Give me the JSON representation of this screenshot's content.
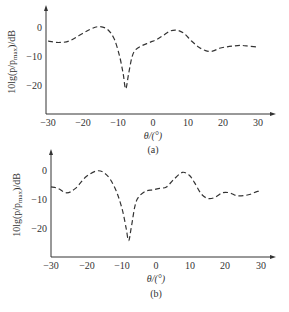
{
  "chart_data": [
    {
      "type": "line",
      "panel_label": "(a)",
      "xlabel": "θ/(°)",
      "ylabel": "10lg(p/p_max)/dB",
      "xlim": [
        -30,
        30
      ],
      "ylim": [
        -25,
        3
      ],
      "x_ticks": [
        -30,
        -20,
        -10,
        0,
        10,
        20,
        30
      ],
      "y_ticks": [
        0,
        -10,
        -20
      ],
      "grid": false,
      "line_style": "dashed",
      "series": [
        {
          "name": "pattern",
          "x": [
            -30,
            -27,
            -24,
            -21,
            -18,
            -15.5,
            -13,
            -11,
            -9.5,
            -8.5,
            -7.8,
            -7,
            -6,
            -5,
            -3,
            -1,
            1,
            3,
            5,
            7,
            9,
            11,
            13,
            15,
            17,
            19,
            21,
            23,
            25,
            27,
            29.5
          ],
          "values": [
            -4.5,
            -5,
            -4.5,
            -2.5,
            -0.5,
            0.5,
            -0.5,
            -4,
            -10,
            -16,
            -21,
            -16,
            -10,
            -7.5,
            -6,
            -5,
            -4,
            -2.5,
            -1,
            -0.8,
            -2,
            -4.5,
            -6.5,
            -7.8,
            -8,
            -7,
            -6.5,
            -6.2,
            -6,
            -6.2,
            -6.5
          ]
        }
      ]
    },
    {
      "type": "line",
      "panel_label": "(b)",
      "xlabel": "θ/(°)",
      "ylabel": "10lg(p/p_max)/dB",
      "xlim": [
        -30,
        30
      ],
      "ylim": [
        -25,
        3
      ],
      "x_ticks": [
        -30,
        -20,
        -10,
        0,
        10,
        20,
        30
      ],
      "y_ticks": [
        0,
        -10,
        -20
      ],
      "grid": false,
      "line_style": "dashed",
      "series": [
        {
          "name": "pattern",
          "x": [
            -30,
            -28,
            -25.5,
            -23,
            -20,
            -17,
            -15,
            -13,
            -11,
            -9.5,
            -8.5,
            -7.8,
            -7,
            -6,
            -5,
            -3,
            -1,
            1,
            3,
            5,
            7.5,
            9.5,
            11,
            13,
            15,
            17,
            19,
            21,
            23,
            25,
            27,
            29,
            30
          ],
          "values": [
            -5.5,
            -6,
            -7.5,
            -6,
            -2,
            0,
            -0.5,
            -3,
            -8,
            -14,
            -20,
            -24,
            -19,
            -12,
            -9,
            -7,
            -6.5,
            -6,
            -5.5,
            -3,
            -0.5,
            -1.5,
            -4,
            -8,
            -9.5,
            -9,
            -7.5,
            -7.5,
            -8.5,
            -8.5,
            -8,
            -7,
            -7.5
          ]
        }
      ]
    }
  ],
  "panels": [
    {
      "caption": "(a)",
      "xlabel": "θ/(°)",
      "ylabel": "10lg(p/p",
      "ylabel_sub": "max",
      "ylabel_tail": ")/dB",
      "xticks": [
        "−30",
        "−20",
        "−10",
        "0",
        "10",
        "20",
        "30"
      ],
      "yticks": [
        "0",
        "−10",
        "−20"
      ]
    },
    {
      "caption": "(b)",
      "xlabel": "θ/(°)",
      "ylabel": "10lg(p/p",
      "ylabel_sub": "max",
      "ylabel_tail": ")/dB",
      "xticks": [
        "−30",
        "−20",
        "−10",
        "0",
        "10",
        "20",
        "30"
      ],
      "yticks": [
        "0",
        "−10",
        "−20"
      ]
    }
  ]
}
